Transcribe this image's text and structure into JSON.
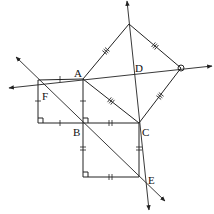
{
  "diagram": {
    "type": "geometry",
    "points": {
      "A": {
        "label": "A",
        "x": 83,
        "y": 79
      },
      "B": {
        "label": "B",
        "x": 83,
        "y": 123
      },
      "C": {
        "label": "C",
        "x": 139,
        "y": 123
      },
      "D": {
        "label": "D",
        "x": 135,
        "y": 72
      },
      "E": {
        "label": "E",
        "x": 146,
        "y": 180
      },
      "F": {
        "label": "F",
        "x": 38,
        "y": 80
      },
      "T": {
        "label": "",
        "x": 129,
        "y": 24
      },
      "R": {
        "label": "",
        "x": 181,
        "y": 68
      },
      "G": {
        "label": "",
        "x": 38,
        "y": 123
      },
      "H": {
        "label": "",
        "x": 83,
        "y": 177
      },
      "K": {
        "label": "",
        "x": 139,
        "y": 177
      }
    },
    "labels": [
      "A",
      "B",
      "C",
      "D",
      "E",
      "F"
    ],
    "squares": [
      {
        "name": "left-square",
        "vertices": [
          "F",
          "A",
          "B",
          "G"
        ],
        "tick_marks": 1
      },
      {
        "name": "bottom-square",
        "vertices": [
          "B",
          "C",
          "K",
          "H"
        ],
        "tick_marks": 2
      },
      {
        "name": "tilted-square",
        "vertices": [
          "A",
          "T",
          "R",
          "C"
        ],
        "tick_marks": 3
      }
    ],
    "lines": [
      {
        "name": "line-F-R",
        "through": [
          "F",
          "R"
        ],
        "arrows": "both"
      },
      {
        "name": "line-T-E",
        "through": [
          "T",
          "E"
        ],
        "arrows": "both"
      },
      {
        "name": "line-F-E",
        "through": [
          "F",
          "E"
        ],
        "arrows": "both"
      }
    ],
    "right_angle_markers": [
      "G",
      "B",
      "H"
    ],
    "colors": {
      "stroke": "#222222",
      "background": "#ffffff"
    }
  }
}
